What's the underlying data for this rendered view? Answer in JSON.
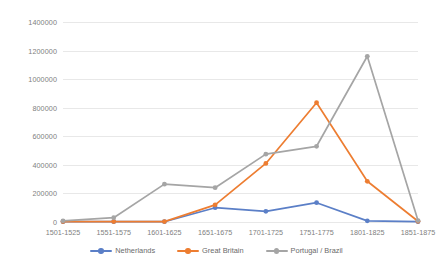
{
  "chart_data": {
    "type": "line",
    "title": "",
    "subtitle": "",
    "xlabel": "",
    "ylabel": "",
    "ylim": [
      0,
      1400000
    ],
    "ytick_labels": [
      "0",
      "200000",
      "400000",
      "600000",
      "800000",
      "1000000",
      "1200000",
      "1400000"
    ],
    "ytick_values": [
      0,
      200000,
      400000,
      600000,
      800000,
      1000000,
      1200000,
      1400000
    ],
    "grid": true,
    "legend_position": "bottom",
    "categories": [
      "1501-1525",
      "1551-1575",
      "1601-1625",
      "1651-1675",
      "1701-1725",
      "1751-1775",
      "1801-1825",
      "1851-1875"
    ],
    "series": [
      {
        "name": "Netherlands",
        "color": "#5b7fc7",
        "values": [
          2000,
          2000,
          2000,
          100000,
          75000,
          135000,
          8000,
          2000
        ]
      },
      {
        "name": "Great Britain",
        "color": "#ed7d31",
        "values": [
          3000,
          3000,
          3000,
          120000,
          410000,
          835000,
          285000,
          5000
        ]
      },
      {
        "name": "Portugal / Brazil",
        "color": "#a5a5a5",
        "values": [
          8000,
          30000,
          265000,
          240000,
          475000,
          530000,
          1160000,
          10000
        ]
      }
    ]
  },
  "legend": {
    "items": [
      {
        "label": "Netherlands",
        "color": "#5b7fc7"
      },
      {
        "label": "Great Britain",
        "color": "#ed7d31"
      },
      {
        "label": "Portugal / Brazil",
        "color": "#a5a5a5"
      }
    ]
  },
  "colors": {
    "netherlands": "#5b7fc7",
    "great_britain": "#ed7d31",
    "portugal_brazil": "#a5a5a5",
    "gridline": "#e8e8e8",
    "axis_text": "#808080",
    "background": "#ffffff"
  }
}
